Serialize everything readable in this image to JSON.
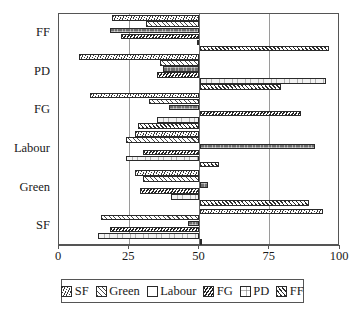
{
  "chart_data": {
    "type": "bar",
    "orientation": "horizontal",
    "title": "",
    "subtitle": "",
    "xlabel": "",
    "ylabel": "",
    "xlim": [
      0,
      100
    ],
    "xticks": [
      0,
      25,
      50,
      75,
      100
    ],
    "xticklabels": [
      "0",
      "25",
      "50",
      "75",
      "100"
    ],
    "grid": true,
    "gridlines_at": [
      25,
      50,
      75
    ],
    "center_value": 50,
    "legend_position": "bottom",
    "legend": [
      "SF",
      "Green",
      "Labour",
      "FG",
      "PD",
      "FF"
    ],
    "categories": [
      "FF",
      "PD",
      "FG",
      "Labour",
      "Green",
      "SF"
    ],
    "series": [
      {
        "name": "SF",
        "pattern": "diagonal-fine-hatch",
        "values": [
          19,
          7,
          11,
          27,
          27,
          94
        ]
      },
      {
        "name": "Green",
        "pattern": "diagonal-sparse-hatch",
        "values": [
          31,
          36,
          32,
          24,
          30,
          15
        ]
      },
      {
        "name": "Labour",
        "pattern": "solid-dark-checker",
        "values": [
          18,
          37,
          39,
          91,
          53,
          46
        ]
      },
      {
        "name": "FG",
        "pattern": "diagonal-dense-hatch",
        "values": [
          22,
          35,
          86,
          30,
          29,
          18
        ]
      },
      {
        "name": "PD",
        "pattern": "light-grid",
        "values": [
          49,
          95,
          35,
          24,
          40,
          14
        ]
      },
      {
        "name": "FF",
        "pattern": "diagonal-medium-hatch",
        "values": [
          96,
          79,
          28,
          57,
          89,
          51
        ]
      }
    ]
  },
  "axis": {
    "x_tick_labels": [
      "0",
      "25",
      "50",
      "75",
      "100"
    ],
    "y_tick_labels": [
      "FF",
      "PD",
      "FG",
      "Labour",
      "Green",
      "SF"
    ]
  },
  "legend_items": [
    {
      "label": "SF",
      "swatch": "hatch-sf-swatch"
    },
    {
      "label": "Green",
      "swatch": "hatch-green-swatch"
    },
    {
      "label": "Labour",
      "swatch": "hatch-labour-swatch"
    },
    {
      "label": "FG",
      "swatch": "hatch-fg-swatch"
    },
    {
      "label": "PD",
      "swatch": "hatch-pd-swatch"
    },
    {
      "label": "FF",
      "swatch": "hatch-ff-swatch"
    }
  ],
  "colors": {
    "axis": "#555555",
    "gridline": "#9a9a9a",
    "bar_outline": "#2a2a2a",
    "background": "#ffffff"
  }
}
